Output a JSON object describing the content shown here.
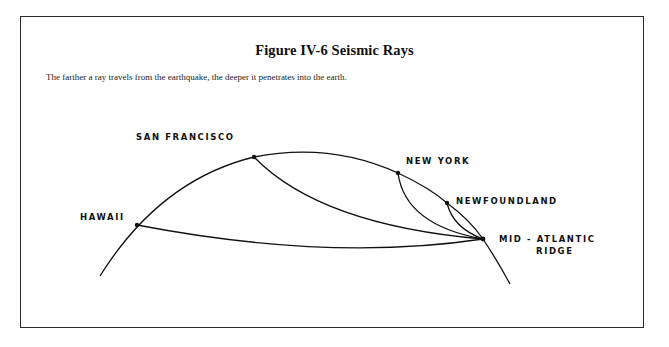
{
  "figure": {
    "title": "Figure IV-6  Seismic Rays",
    "caption": "The farther a ray travels from the earthquake, the deeper it penetrates into the earth."
  },
  "diagram": {
    "earthquake_source": "MID-ATLANTIC RIDGE",
    "labels": {
      "hawaii": "HAWAII",
      "san_francisco": "SAN FRANCISCO",
      "new_york": "NEW YORK",
      "newfoundland": "NEWFOUNDLAND",
      "mid_atlantic_line1": "MID - ATLANTIC",
      "mid_atlantic_line2": "RIDGE"
    },
    "stations": [
      {
        "name": "HAWAII",
        "order_by_distance": 4
      },
      {
        "name": "SAN FRANCISCO",
        "order_by_distance": 3
      },
      {
        "name": "NEW YORK",
        "order_by_distance": 2
      },
      {
        "name": "NEWFOUNDLAND",
        "order_by_distance": 1
      }
    ],
    "line_color": "#111111",
    "background_color": "#ffffff"
  }
}
